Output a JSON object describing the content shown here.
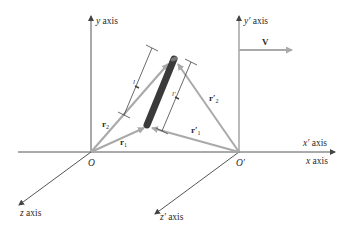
{
  "diagram": {
    "colors": {
      "axis": "#555555",
      "vector": "#a9a9a9",
      "rod": "#3a3a3a",
      "dimension": "#444444",
      "text": "#2a2a2a"
    },
    "frames": {
      "unprimed": {
        "origin_label": "O",
        "y_axis_label_var": "y",
        "y_axis_label_word": " axis",
        "x_axis_label_var": "x",
        "x_axis_label_word": " axis",
        "z_axis_label_var": "z",
        "z_axis_label_word": " axis"
      },
      "primed": {
        "origin_label": "O′",
        "y_axis_label_var": "y′",
        "y_axis_label_word": " axis",
        "x_axis_label_var": "x′",
        "x_axis_label_word": " axis",
        "z_axis_label_var": "z′",
        "z_axis_label_word": " axis"
      }
    },
    "velocity": {
      "label": "V"
    },
    "vectors": {
      "r1": {
        "base": "r",
        "sub": "1"
      },
      "r2": {
        "base": "r",
        "sub": "2"
      },
      "r1p": {
        "base": "r′",
        "sub": "1"
      },
      "r2p": {
        "base": "r′",
        "sub": "2"
      }
    },
    "lengths": {
      "l": "l",
      "lp": "l′"
    }
  }
}
